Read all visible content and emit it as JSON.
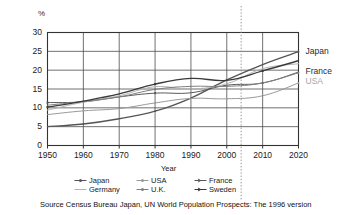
{
  "chart_data": {
    "type": "line",
    "title": "",
    "subtitle": "",
    "xlabel": "Year",
    "ylabel": "%",
    "ylim": [
      0,
      30
    ],
    "xlim": [
      1950,
      2020
    ],
    "ytick_labels": [
      "0",
      "5",
      "10",
      "15",
      "20",
      "25",
      "30"
    ],
    "ytick_values": [
      0,
      5,
      10,
      15,
      20,
      25,
      30
    ],
    "xtick_labels": [
      "1950",
      "1960",
      "1970",
      "1980",
      "1990",
      "2000",
      "2010",
      "2020"
    ],
    "xtick_values": [
      1950,
      1960,
      1970,
      1980,
      1990,
      2000,
      2010,
      2020
    ],
    "grid": true,
    "legend_position": "bottom",
    "x": [
      1950,
      1960,
      1970,
      1980,
      1990,
      2000,
      2010,
      2020
    ],
    "series": [
      {
        "name": "Japan",
        "color": "#555555",
        "marker": "line-dot",
        "values": [
          5.0,
          5.7,
          7.1,
          9.1,
          12.6,
          17.4,
          21.5,
          24.9
        ]
      },
      {
        "name": "USA",
        "color": "#9a9a9a",
        "marker": "line-dot",
        "values": [
          8.2,
          9.2,
          9.8,
          11.3,
          12.5,
          12.4,
          13.2,
          16.6
        ]
      },
      {
        "name": "France",
        "color": "#5a5a5a",
        "marker": "line-arrow",
        "values": [
          11.4,
          11.6,
          12.9,
          13.9,
          14.0,
          16.0,
          16.6,
          19.5
        ]
      },
      {
        "name": "Germany",
        "color": "#b4b4b4",
        "marker": "line-plain",
        "values": [
          9.4,
          11.5,
          13.2,
          15.6,
          15.0,
          16.4,
          20.4,
          21.7
        ]
      },
      {
        "name": "U.K.",
        "color": "#808080",
        "marker": "line-dot",
        "values": [
          10.7,
          11.7,
          12.9,
          14.9,
          15.7,
          15.7,
          16.6,
          19.3
        ]
      },
      {
        "name": "Sweden",
        "color": "#3a3a3a",
        "marker": "line-arrow",
        "values": [
          10.2,
          11.8,
          13.7,
          16.3,
          17.8,
          17.3,
          19.8,
          22.5
        ]
      }
    ],
    "annotations": {
      "projection_line_year": 2004,
      "projection_line_style": "dotted",
      "right_labels": [
        {
          "text": "Japan",
          "value": 24.9,
          "color": "#2b2b2b"
        },
        {
          "text": "France",
          "value": 19.6,
          "color": "#2b2b2b"
        },
        {
          "text": "USA",
          "value": 17.0,
          "color": "#a6a6a6"
        }
      ]
    },
    "source": "Source Census Bureau Japan, UN World Population Prospects: The 1996 version"
  },
  "legend": {
    "entries": [
      {
        "label": "Japan",
        "color": "#555555",
        "marker": "marker-dot"
      },
      {
        "label": "USA",
        "color": "#9a9a9a",
        "marker": "marker-dot"
      },
      {
        "label": "France",
        "color": "#5a5a5a",
        "marker": "marker-arrow"
      },
      {
        "label": "Germany",
        "color": "#b4b4b4",
        "marker": "marker-plain"
      },
      {
        "label": "U.K.",
        "color": "#808080",
        "marker": "marker-dot"
      },
      {
        "label": "Sweden",
        "color": "#3a3a3a",
        "marker": "marker-arrow"
      }
    ]
  }
}
